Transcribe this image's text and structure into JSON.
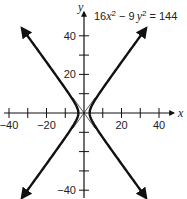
{
  "chart_data": {
    "type": "line",
    "title": "",
    "equation": "16x^2 - 9y^2 = 144",
    "equation_parts": {
      "coef1": "16",
      "var1": "x",
      "exp1": "2",
      "minus": " − 9",
      "var2": "y",
      "exp2": "2",
      "rhs": " = 144"
    },
    "xlabel": "x",
    "ylabel": "y",
    "xlim": [
      -44,
      47
    ],
    "ylim": [
      -44,
      46
    ],
    "xticks": [
      -40,
      -30,
      -20,
      -10,
      10,
      20,
      30,
      40
    ],
    "yticks": [
      -40,
      -30,
      -20,
      -10,
      10,
      20,
      30,
      40
    ],
    "xtick_labels": [
      {
        "value": -40,
        "label": "−40"
      },
      {
        "value": -20,
        "label": "−20"
      },
      {
        "value": 20,
        "label": "20"
      },
      {
        "value": 40,
        "label": "40"
      }
    ],
    "ytick_labels": [
      {
        "value": 40,
        "label": "40"
      },
      {
        "value": 20,
        "label": "20"
      },
      {
        "value": -40,
        "label": "−40"
      }
    ],
    "grid": false,
    "series": [
      {
        "name": "hyperbola right branch",
        "curve": "x = 3*sqrt(1 + y^2/16)",
        "vertex": [
          3,
          0
        ],
        "y_range": [
          -44,
          44
        ]
      },
      {
        "name": "hyperbola left branch",
        "curve": "x = -3*sqrt(1 + y^2/16)",
        "vertex": [
          -3,
          0
        ],
        "y_range": [
          -44,
          44
        ]
      },
      {
        "name": "asymptote",
        "curve": "y = (4/3)x",
        "style": "thin"
      },
      {
        "name": "asymptote",
        "curve": "y = -(4/3)x",
        "style": "thin"
      }
    ],
    "vertices": [
      [
        -3,
        0
      ],
      [
        3,
        0
      ]
    ],
    "asymptotes": [
      "y = 4x/3",
      "y = -4x/3"
    ]
  },
  "labels": {
    "x_axis": "x",
    "y_axis": "y"
  }
}
